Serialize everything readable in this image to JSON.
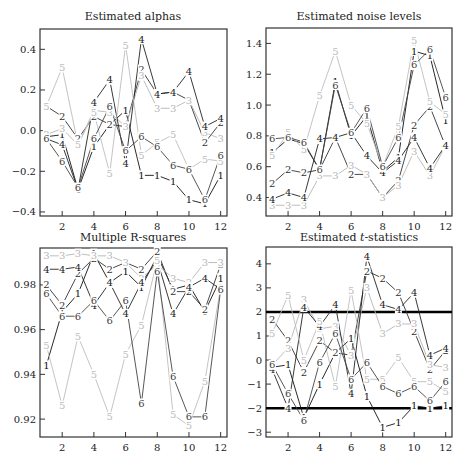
{
  "figure": {
    "background": "#ffffff",
    "series_colors": {
      "1": "#111111",
      "2": "#333333",
      "3": "#b5b5b5",
      "4": "#222222",
      "5": "#bdbdbd",
      "6": "#444444"
    }
  },
  "chart_data": [
    {
      "type": "line",
      "title": "Estimated alphas",
      "xlabel": "",
      "ylabel": "",
      "x": [
        1,
        2,
        3,
        4,
        5,
        6,
        7,
        8,
        9,
        10,
        11,
        12
      ],
      "xticks": [
        2,
        4,
        6,
        8,
        10,
        12
      ],
      "yticks": [
        -0.4,
        -0.2,
        0.0,
        0.2,
        0.4
      ],
      "ytick_labels": [
        "−0.4",
        "−0.2",
        "0.0",
        "0.2",
        "0.4"
      ],
      "ylim": [
        -0.42,
        0.5
      ],
      "xlim": [
        0.6,
        12.4
      ],
      "grid": false,
      "marker": "series number as digit",
      "series": [
        {
          "name": "1",
          "values": [
            -0.03,
            -0.02,
            -0.29,
            -0.08,
            0.03,
            0.1,
            -0.22,
            -0.22,
            -0.25,
            -0.34,
            -0.36,
            -0.22
          ]
        },
        {
          "name": "2",
          "values": [
            0.12,
            0.07,
            -0.04,
            0.07,
            0.03,
            0.02,
            0.3,
            0.18,
            0.19,
            0.15,
            -0.06,
            0.04
          ]
        },
        {
          "name": "3",
          "values": [
            -0.02,
            0.01,
            -0.07,
            0.1,
            0.09,
            0.02,
            0.27,
            0.11,
            0.11,
            0.15,
            -0.01,
            -0.04
          ]
        },
        {
          "name": "4",
          "values": [
            -0.04,
            -0.07,
            -0.29,
            0.14,
            0.25,
            -0.16,
            0.45,
            0.18,
            0.19,
            0.29,
            0.02,
            0.06
          ]
        },
        {
          "name": "5",
          "values": [
            0.12,
            0.31,
            -0.07,
            0.09,
            -0.21,
            0.42,
            -0.12,
            -0.06,
            -0.02,
            -0.19,
            -0.14,
            -0.15
          ]
        },
        {
          "name": "6",
          "values": [
            -0.04,
            -0.15,
            -0.28,
            -0.04,
            0.12,
            -0.1,
            -0.03,
            -0.08,
            -0.17,
            -0.19,
            -0.34,
            -0.12
          ]
        }
      ]
    },
    {
      "type": "line",
      "title": "Estimated noise levels",
      "xlabel": "",
      "ylabel": "",
      "x": [
        1,
        2,
        3,
        4,
        5,
        6,
        7,
        8,
        9,
        10,
        11,
        12
      ],
      "xticks": [
        2,
        4,
        6,
        8,
        10,
        12
      ],
      "yticks": [
        0.4,
        0.6,
        0.8,
        1.0,
        1.2,
        1.4
      ],
      "ytick_labels": [
        "0.4",
        "0.6",
        "0.8",
        "1.0",
        "1.2",
        "1.4"
      ],
      "ylim": [
        0.28,
        1.5
      ],
      "xlim": [
        0.6,
        12.4
      ],
      "grid": false,
      "marker": "series number as digit",
      "series": [
        {
          "name": "1",
          "values": [
            0.69,
            0.78,
            0.75,
            0.58,
            1.15,
            0.8,
            0.93,
            0.57,
            0.66,
            1.35,
            1.32,
            0.9
          ]
        },
        {
          "name": "2",
          "values": [
            0.49,
            0.58,
            0.56,
            0.58,
            0.79,
            0.55,
            0.55,
            0.4,
            0.51,
            0.87,
            0.99,
            0.73
          ]
        },
        {
          "name": "3",
          "values": [
            0.35,
            0.35,
            0.35,
            0.54,
            0.54,
            0.61,
            0.55,
            0.4,
            0.48,
            0.7,
            0.54,
            0.74
          ]
        },
        {
          "name": "4",
          "values": [
            0.39,
            0.43,
            0.4,
            0.78,
            0.79,
            0.82,
            0.67,
            0.56,
            0.64,
            0.79,
            0.59,
            0.74
          ]
        },
        {
          "name": "5",
          "values": [
            0.67,
            0.82,
            0.71,
            1.06,
            1.35,
            1.0,
            0.88,
            0.6,
            0.86,
            1.42,
            1.02,
            0.94
          ]
        },
        {
          "name": "6",
          "values": [
            0.78,
            0.79,
            0.76,
            0.58,
            1.13,
            0.82,
            0.98,
            0.6,
            0.79,
            1.26,
            1.36,
            1.05
          ]
        }
      ]
    },
    {
      "type": "line",
      "title": "Multiple R-squares",
      "xlabel": "",
      "ylabel": "",
      "x": [
        1,
        2,
        3,
        4,
        5,
        6,
        7,
        8,
        9,
        10,
        11,
        12
      ],
      "xticks": [
        2,
        4,
        6,
        8,
        10,
        12
      ],
      "yticks": [
        0.92,
        0.94,
        0.96,
        0.98
      ],
      "ytick_labels": [
        "0.92",
        "0.94",
        "0.96",
        "0.98"
      ],
      "ylim": [
        0.912,
        0.9965
      ],
      "xlim": [
        0.6,
        12.4
      ],
      "grid": false,
      "marker": "series number as digit",
      "series": [
        {
          "name": "1",
          "values": [
            0.944,
            0.968,
            0.976,
            0.994,
            0.981,
            0.986,
            0.979,
            0.993,
            0.978,
            0.98,
            0.968,
            0.983
          ]
        },
        {
          "name": "2",
          "values": [
            0.98,
            0.971,
            0.985,
            0.992,
            0.987,
            0.99,
            0.987,
            0.995,
            0.977,
            0.977,
            0.969,
            0.989
          ]
        },
        {
          "name": "3",
          "values": [
            0.993,
            0.993,
            0.994,
            0.993,
            0.993,
            0.99,
            0.983,
            0.989,
            0.983,
            0.981,
            0.99,
            0.99
          ]
        },
        {
          "name": "4",
          "values": [
            0.987,
            0.987,
            0.988,
            0.971,
            0.981,
            0.967,
            0.981,
            0.991,
            0.967,
            0.979,
            0.983,
            0.978
          ]
        },
        {
          "name": "5",
          "values": [
            0.953,
            0.926,
            0.957,
            0.94,
            0.921,
            0.949,
            0.962,
            0.991,
            0.922,
            0.917,
            0.937,
            0.979
          ]
        },
        {
          "name": "6",
          "values": [
            0.976,
            0.966,
            0.966,
            0.973,
            0.964,
            0.973,
            0.927,
            0.986,
            0.939,
            0.921,
            0.921,
            0.978
          ]
        }
      ]
    },
    {
      "type": "line",
      "title": "Estimated t-statistics",
      "title_prefix": "Estimated ",
      "title_italic": "t",
      "title_suffix": "-statistics",
      "xlabel": "",
      "ylabel": "",
      "x": [
        1,
        2,
        3,
        4,
        5,
        6,
        7,
        8,
        9,
        10,
        11,
        12
      ],
      "xticks": [
        2,
        4,
        6,
        8,
        10,
        12
      ],
      "yticks": [
        -3,
        -2,
        -1,
        0,
        1,
        2,
        3,
        4
      ],
      "ytick_labels": [
        "−3",
        "−2",
        "−1",
        "0",
        "1",
        "2",
        "3",
        "4"
      ],
      "ylim": [
        -3.2,
        4.7
      ],
      "xlim": [
        0.6,
        12.4
      ],
      "grid": false,
      "reference_lines": [
        2.0,
        -2.0
      ],
      "marker": "series number as digit",
      "series": [
        {
          "name": "1",
          "values": [
            -0.3,
            -0.2,
            -2.4,
            -1.0,
            0.3,
            0.9,
            -1.5,
            -2.8,
            -2.6,
            -1.9,
            -2.0,
            -1.9
          ]
        },
        {
          "name": "2",
          "values": [
            1.7,
            0.8,
            -0.5,
            0.8,
            0.3,
            0.2,
            3.7,
            3.4,
            2.8,
            1.2,
            -0.4,
            0.4
          ]
        },
        {
          "name": "3",
          "values": [
            -0.2,
            0.5,
            2.5,
            1.3,
            1.4,
            0.2,
            3.0,
            1.1,
            1.5,
            1.5,
            -0.2,
            -0.3
          ]
        },
        {
          "name": "4",
          "values": [
            -0.4,
            -2.0,
            2.2,
            1.4,
            2.3,
            -1.4,
            4.3,
            2.3,
            2.1,
            2.8,
            0.2,
            0.5
          ]
        },
        {
          "name": "5",
          "values": [
            1.1,
            2.7,
            0.0,
            1.6,
            -1.1,
            2.9,
            -0.8,
            -0.8,
            0.1,
            -0.9,
            -0.9,
            -1.3
          ]
        },
        {
          "name": "6",
          "values": [
            -0.2,
            -1.4,
            -2.5,
            -0.1,
            1.1,
            -0.8,
            -0.1,
            -1.1,
            -1.4,
            -1.1,
            -1.7,
            -0.9
          ]
        }
      ]
    }
  ]
}
